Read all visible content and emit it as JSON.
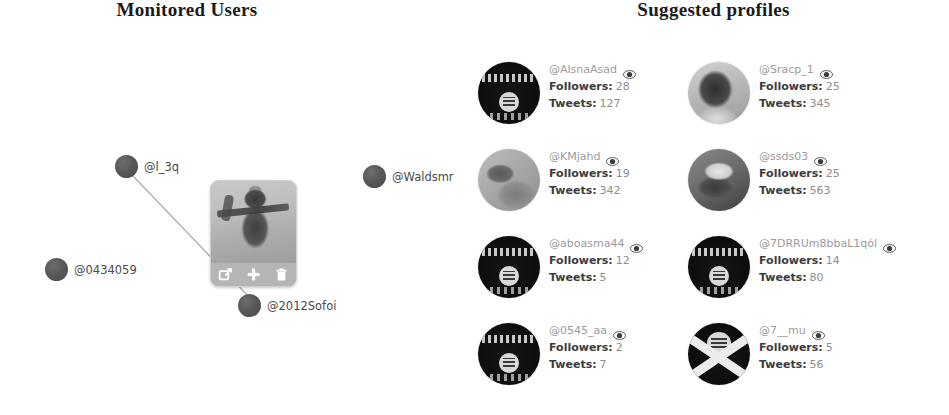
{
  "monitored": {
    "title": "Monitored Users",
    "nodes": [
      {
        "label": "@l_3q",
        "x": 115,
        "y": 155,
        "icon": "user-node-icon"
      },
      {
        "label": "@0434059",
        "x": 45,
        "y": 258,
        "icon": "user-node-icon"
      },
      {
        "label": "@2012Sofoi",
        "x": 238,
        "y": 294,
        "icon": "user-node-icon"
      },
      {
        "label": "@Waldsmr",
        "x": 363,
        "y": 165,
        "icon": "user-node-icon"
      }
    ],
    "edges": [
      {
        "from": "@l_3q",
        "to": "@2012Sofoi"
      }
    ],
    "popup": {
      "photo_alt": "profile-photo",
      "buttons": [
        {
          "name": "open-external-button",
          "icon": "external-link-icon",
          "label": "Open"
        },
        {
          "name": "add-node-button",
          "icon": "plus-icon",
          "label": "Add"
        },
        {
          "name": "delete-node-button",
          "icon": "trash-icon",
          "label": "Delete"
        }
      ]
    }
  },
  "suggested": {
    "title": "Suggested profiles",
    "followers_label": "Followers:",
    "tweets_label": "Tweets:",
    "watch_icon": "eye-icon",
    "profiles": [
      {
        "handle": "@AlsnaAsad",
        "followers": "28",
        "tweets": "127",
        "avatar": "flag"
      },
      {
        "handle": "@Sracp_1",
        "followers": "25",
        "tweets": "345",
        "avatar": "photo"
      },
      {
        "handle": "@KMjahd",
        "followers": "19",
        "tweets": "342",
        "avatar": "photo2"
      },
      {
        "handle": "@ssds03",
        "followers": "25",
        "tweets": "563",
        "avatar": "photo3"
      },
      {
        "handle": "@aboasma44",
        "followers": "12",
        "tweets": "5",
        "avatar": "flag"
      },
      {
        "handle": "@7DRRUm8bbaL1qól",
        "followers": "14",
        "tweets": "80",
        "avatar": "flag"
      },
      {
        "handle": "@0545_aa",
        "followers": "2",
        "tweets": "7",
        "avatar": "flag"
      },
      {
        "handle": "@7__mu",
        "followers": "5",
        "tweets": "56",
        "avatar": "crossed"
      }
    ]
  },
  "colors": {
    "background": "#ffffff",
    "title": "#1a1a1a",
    "node": "#585858",
    "handle": "#9b9b9b",
    "stat_key": "#3c3c3c",
    "stat_value": "#8e8e8e",
    "edge": "#b0b0b0",
    "popup_bg": "#bdbdbd"
  }
}
